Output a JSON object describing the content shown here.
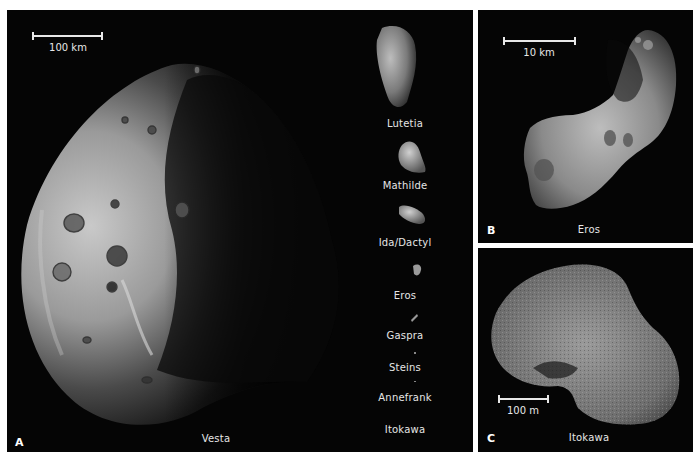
{
  "figure": {
    "background": "#ffffff",
    "panel_background": "#050505",
    "text_color": "#e6e6e6"
  },
  "panel_a": {
    "letter": "A",
    "caption": "Vesta",
    "scale_bar": "100 km",
    "comparison_column": [
      {
        "name": "Lutetia"
      },
      {
        "name": "Mathilde"
      },
      {
        "name": "Ida/Dactyl"
      },
      {
        "name": "Eros"
      },
      {
        "name": "Gaspra"
      },
      {
        "name": "Steins"
      },
      {
        "name": "Annefrank"
      },
      {
        "name": "Itokawa"
      }
    ]
  },
  "panel_b": {
    "letter": "B",
    "caption": "Eros",
    "scale_bar": "10 km"
  },
  "panel_c": {
    "letter": "C",
    "caption": "Itokawa",
    "scale_bar": "100 m"
  }
}
